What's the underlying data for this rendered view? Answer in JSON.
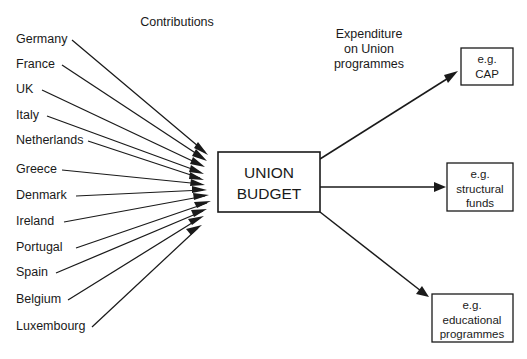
{
  "diagram": {
    "title": "UNION BUDGET",
    "headings": {
      "left": "Contributions",
      "right_line1": "Expenditure",
      "right_line2": "on Union",
      "right_line3": "programmes"
    },
    "center_box": {
      "line1": "UNION",
      "line2": "BUDGET"
    },
    "contributors": [
      {
        "name": "Germany",
        "y": 40
      },
      {
        "name": "France",
        "y": 65
      },
      {
        "name": "UK",
        "y": 90
      },
      {
        "name": "Italy",
        "y": 116
      },
      {
        "name": "Netherlands",
        "y": 141
      },
      {
        "name": "Greece",
        "y": 170
      },
      {
        "name": "Denmark",
        "y": 196
      },
      {
        "name": "Ireland",
        "y": 222
      },
      {
        "name": "Portugal",
        "y": 248
      },
      {
        "name": "Spain",
        "y": 273
      },
      {
        "name": "Belgium",
        "y": 300
      },
      {
        "name": "Luxembourg",
        "y": 327
      }
    ],
    "outcomes": [
      {
        "line1": "e.g.",
        "line2": "CAP",
        "line3": ""
      },
      {
        "line1": "e.g.",
        "line2": "structural",
        "line3": "funds"
      },
      {
        "line1": "e.g.",
        "line2": "educational",
        "line3": "programmes"
      }
    ],
    "colors": {
      "ink": "#1a1a1a",
      "paper": "#ffffff"
    }
  }
}
